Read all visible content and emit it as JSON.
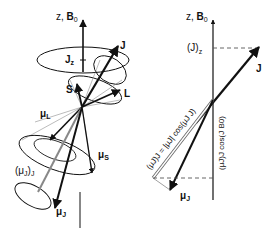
{
  "left_diagram": {
    "axis_label_z": "z, ",
    "axis_label_B": "B",
    "axis_label_B_sub": "0",
    "label_Jz": "J",
    "label_Jz_sub": "z",
    "label_J": "J",
    "label_L": "L",
    "label_S": "S",
    "label_muL": "μ",
    "label_muL_sub": "L",
    "label_muS": "μ",
    "label_muS_sub": "S",
    "label_muJJ": "(μ",
    "label_muJJ_mid": "J",
    "label_muJJ_close": ")",
    "label_muJJ_sub": "J",
    "label_muJ": "μ",
    "label_muJ_sub": "J"
  },
  "right_diagram": {
    "axis_label_z": "z, ",
    "axis_label_B": "B",
    "axis_label_B_sub": "0",
    "label_Jz": "(J)",
    "label_Jz_sub": "z",
    "label_J": "J",
    "label_muJ": "μ",
    "label_muJ_sub": "J",
    "formula_projection_J": "(μJ)J = |μJ| cos(μJ J)",
    "formula_projection_z": "(μJ)J cos(J B0)"
  },
  "colors": {
    "stroke": "#111111",
    "gray_arrow": "#888888",
    "dashed": "#555555"
  }
}
